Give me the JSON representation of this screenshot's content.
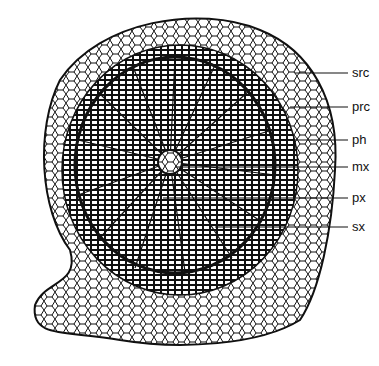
{
  "figure": {
    "labels": [
      {
        "id": "src",
        "text": "src",
        "x": 352,
        "y": 73,
        "line_from": 295
      },
      {
        "id": "prc",
        "text": "prc",
        "x": 352,
        "y": 107,
        "line_from": 290
      },
      {
        "id": "ph",
        "text": "ph",
        "x": 352,
        "y": 140,
        "line_from": 255
      },
      {
        "id": "mx",
        "text": "mx",
        "x": 352,
        "y": 167,
        "line_from": 175
      },
      {
        "id": "px",
        "text": "px",
        "x": 352,
        "y": 198,
        "line_from": 163
      },
      {
        "id": "sx",
        "text": "sx",
        "x": 352,
        "y": 227,
        "line_from": 215
      }
    ]
  }
}
